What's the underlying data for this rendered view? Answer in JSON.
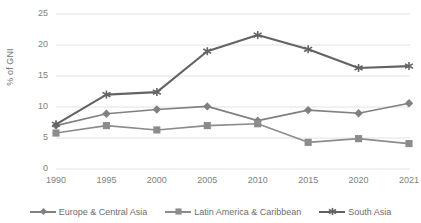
{
  "chart_data": {
    "type": "line",
    "title": "",
    "xlabel": "",
    "ylabel": "% of GNI",
    "categories": [
      "1990",
      "1995",
      "2000",
      "2005",
      "2010",
      "2015",
      "2020",
      "2021"
    ],
    "ylim": [
      0,
      25
    ],
    "yticks": [
      0,
      5,
      10,
      15,
      20,
      25
    ],
    "grid": true,
    "legend_position": "bottom",
    "series": [
      {
        "name": "Europe & Central Asia",
        "marker": "diamond",
        "color": "#808080",
        "values": [
          7.0,
          8.9,
          9.6,
          10.1,
          7.8,
          9.5,
          9.0,
          10.6
        ]
      },
      {
        "name": "Latin America & Caribbean",
        "marker": "square",
        "color": "#8c8c8c",
        "values": [
          5.8,
          7.0,
          6.3,
          7.0,
          7.3,
          4.3,
          4.9,
          4.1
        ]
      },
      {
        "name": "South Asia",
        "marker": "asterisk",
        "color": "#636363",
        "values": [
          7.2,
          12.0,
          12.4,
          19.0,
          21.6,
          19.3,
          16.3,
          16.6
        ]
      }
    ]
  },
  "axis": {
    "y_title": "% of GNI",
    "y_tick_labels": [
      "25",
      "20",
      "15",
      "10",
      "5",
      "0"
    ],
    "x_tick_labels": [
      "1990",
      "1995",
      "2000",
      "2005",
      "2010",
      "2015",
      "2020",
      "2021"
    ]
  },
  "legend": {
    "items": [
      {
        "label": "Europe & Central Asia"
      },
      {
        "label": "Latin America & Caribbean"
      },
      {
        "label": "South Asia"
      }
    ]
  },
  "colors": {
    "grid": "#e2e2e2",
    "text": "#808080",
    "series_1": "#808080",
    "series_2": "#8c8c8c",
    "series_3": "#636363",
    "background": "#ffffff"
  }
}
